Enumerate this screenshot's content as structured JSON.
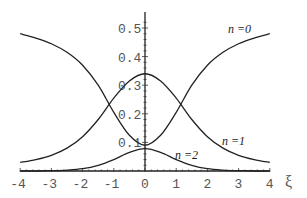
{
  "chart_data": {
    "type": "line",
    "title": "",
    "xlabel": "ξ",
    "ylabel": "",
    "xlim": [
      -4,
      4
    ],
    "ylim": [
      0,
      0.55
    ],
    "grid": false,
    "x_ticks": [
      "-4",
      "-3",
      "-2",
      "-1",
      "0",
      "1",
      "2",
      "3",
      "4"
    ],
    "y_ticks": [
      "0.1",
      "0.2",
      "0.3",
      "0.4",
      "0.5"
    ],
    "x": [
      -4,
      -3.5,
      -3,
      -2.5,
      -2,
      -1.5,
      -1,
      -0.5,
      0,
      0.5,
      1,
      1.5,
      2,
      2.5,
      3,
      3.5,
      4
    ],
    "series": [
      {
        "name": "n =0",
        "values": [
          0.48,
          0.465,
          0.445,
          0.415,
          0.37,
          0.3,
          0.205,
          0.125,
          0.09,
          0.125,
          0.205,
          0.3,
          0.37,
          0.415,
          0.445,
          0.465,
          0.48
        ]
      },
      {
        "name": "n =1",
        "values": [
          0.03,
          0.04,
          0.055,
          0.08,
          0.12,
          0.18,
          0.255,
          0.315,
          0.34,
          0.315,
          0.255,
          0.18,
          0.12,
          0.08,
          0.055,
          0.04,
          0.03
        ]
      },
      {
        "name": "n =2",
        "values": [
          0.0,
          0.0,
          0.001,
          0.003,
          0.008,
          0.02,
          0.04,
          0.065,
          0.078,
          0.065,
          0.04,
          0.02,
          0.008,
          0.003,
          0.001,
          0.0,
          0.0
        ]
      }
    ],
    "annotations": [
      {
        "text": "n =0",
        "x": 2.6,
        "y": 0.49
      },
      {
        "text": "n =1",
        "x": 2.7,
        "y": 0.155
      },
      {
        "text": "n =2",
        "x": 0.9,
        "y": 0.085
      }
    ]
  },
  "labels": {
    "n0": "n =0",
    "n1": "n =1",
    "n2": "n =2",
    "xi": "ξ"
  }
}
